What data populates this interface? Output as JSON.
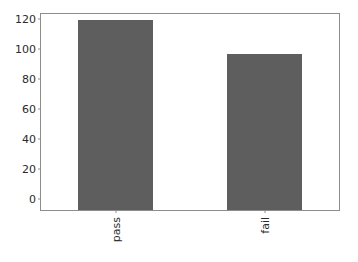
{
  "chart_data": {
    "type": "bar",
    "title": "",
    "xlabel": "",
    "ylabel": "",
    "categories": [
      "pass",
      "fail"
    ],
    "values": [
      127,
      104
    ],
    "series": [
      {
        "name": "count",
        "values": [
          127,
          104
        ]
      }
    ],
    "yticks": [
      0,
      20,
      40,
      60,
      80,
      100,
      120
    ],
    "ytick_labels": [
      "0",
      "20",
      "40",
      "60",
      "80",
      "100",
      "120"
    ],
    "ylim": [
      0,
      131
    ],
    "xtick_labels": [
      "pass",
      "fail"
    ],
    "xtick_rotation": 90,
    "grid": false,
    "legend": false,
    "legend_position": "none",
    "bar_color": "#5e5e5e",
    "axis_color": "#8d8d8d",
    "text_color": "#2b2b2b",
    "background_color": "#ffffff"
  }
}
